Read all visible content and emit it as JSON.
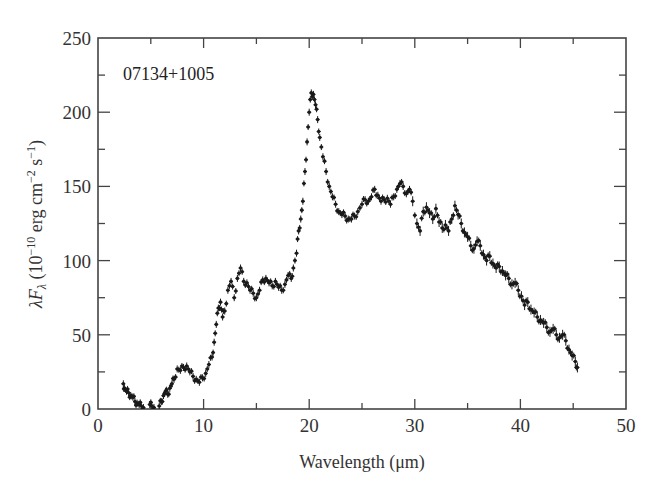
{
  "chart_data": {
    "type": "scatter",
    "title": "",
    "annotation": "07134+1005",
    "xlabel": "Wavelength (μm)",
    "ylabel": "λF_λ (10^-10 erg cm^-2 s^-1)",
    "xlim": [
      0,
      50
    ],
    "ylim": [
      0,
      250
    ],
    "xticks": [
      0,
      10,
      20,
      30,
      40,
      50
    ],
    "yticks": [
      0,
      50,
      100,
      150,
      200,
      250
    ],
    "x_minor_step": 5,
    "y_minor_step": 25,
    "grid": false,
    "legend": null,
    "marker": "point with error bars",
    "series": [
      {
        "name": "07134+1005",
        "points": [
          [
            2.4,
            17
          ],
          [
            2.5,
            14
          ],
          [
            2.7,
            12
          ],
          [
            2.9,
            11
          ],
          [
            3.1,
            9
          ],
          [
            3.3,
            8
          ],
          [
            3.5,
            5
          ],
          [
            3.7,
            4
          ],
          [
            3.9,
            3
          ],
          [
            4.1,
            2
          ],
          [
            4.3,
            1
          ],
          [
            4.9,
            3
          ],
          [
            5.1,
            2
          ],
          [
            5.3,
            1
          ],
          [
            5.8,
            2
          ],
          [
            6.0,
            5
          ],
          [
            6.2,
            9
          ],
          [
            6.4,
            12
          ],
          [
            6.6,
            10
          ],
          [
            6.8,
            14
          ],
          [
            7.0,
            17
          ],
          [
            7.2,
            20
          ],
          [
            7.5,
            27
          ],
          [
            7.8,
            26
          ],
          [
            8.1,
            28
          ],
          [
            8.4,
            29
          ],
          [
            8.7,
            25
          ],
          [
            9.0,
            22
          ],
          [
            9.3,
            20
          ],
          [
            9.6,
            18
          ],
          [
            9.9,
            21
          ],
          [
            10.2,
            24
          ],
          [
            10.5,
            30
          ],
          [
            10.8,
            35
          ],
          [
            11.0,
            45
          ],
          [
            11.2,
            57
          ],
          [
            11.4,
            68
          ],
          [
            11.6,
            72
          ],
          [
            11.8,
            62
          ],
          [
            12.0,
            66
          ],
          [
            12.3,
            80
          ],
          [
            12.6,
            86
          ],
          [
            12.9,
            75
          ],
          [
            13.2,
            88
          ],
          [
            13.5,
            95
          ],
          [
            13.8,
            86
          ],
          [
            14.1,
            85
          ],
          [
            14.4,
            80
          ],
          [
            14.7,
            78
          ],
          [
            15.0,
            75
          ],
          [
            15.3,
            80
          ],
          [
            15.6,
            87
          ],
          [
            15.9,
            88
          ],
          [
            16.2,
            85
          ],
          [
            16.5,
            83
          ],
          [
            16.8,
            86
          ],
          [
            17.1,
            82
          ],
          [
            17.4,
            80
          ],
          [
            17.7,
            84
          ],
          [
            18.0,
            90
          ],
          [
            18.3,
            88
          ],
          [
            18.5,
            95
          ],
          [
            18.8,
            105
          ],
          [
            19.0,
            120
          ],
          [
            19.2,
            128
          ],
          [
            19.4,
            140
          ],
          [
            19.6,
            160
          ],
          [
            19.8,
            180
          ],
          [
            20.0,
            200
          ],
          [
            20.2,
            213
          ],
          [
            20.4,
            212
          ],
          [
            20.6,
            205
          ],
          [
            20.8,
            195
          ],
          [
            21.0,
            183
          ],
          [
            21.3,
            170
          ],
          [
            21.6,
            160
          ],
          [
            21.9,
            150
          ],
          [
            22.2,
            143
          ],
          [
            22.5,
            138
          ],
          [
            22.8,
            133
          ],
          [
            23.1,
            131
          ],
          [
            23.4,
            130
          ],
          [
            23.7,
            128
          ],
          [
            24.0,
            128
          ],
          [
            24.3,
            130
          ],
          [
            24.6,
            133
          ],
          [
            25.0,
            138
          ],
          [
            25.3,
            141
          ],
          [
            25.6,
            140
          ],
          [
            25.9,
            143
          ],
          [
            26.2,
            148
          ],
          [
            26.5,
            144
          ],
          [
            26.8,
            140
          ],
          [
            27.1,
            141
          ],
          [
            27.4,
            142
          ],
          [
            27.7,
            138
          ],
          [
            28.0,
            143
          ],
          [
            28.3,
            148
          ],
          [
            28.6,
            152
          ],
          [
            28.9,
            150
          ],
          [
            29.2,
            145
          ],
          [
            29.5,
            148
          ],
          [
            29.8,
            140
          ],
          [
            30.2,
            125
          ],
          [
            30.5,
            120
          ],
          [
            30.8,
            133
          ],
          [
            31.1,
            136
          ],
          [
            31.4,
            132
          ],
          [
            31.7,
            128
          ],
          [
            32.0,
            135
          ],
          [
            32.3,
            126
          ],
          [
            32.6,
            122
          ],
          [
            32.9,
            124
          ],
          [
            33.2,
            120
          ],
          [
            33.5,
            128
          ],
          [
            33.8,
            137
          ],
          [
            34.1,
            131
          ],
          [
            34.4,
            125
          ],
          [
            34.7,
            119
          ],
          [
            35.0,
            116
          ],
          [
            35.3,
            110
          ],
          [
            35.6,
            108
          ],
          [
            35.9,
            113
          ],
          [
            36.2,
            110
          ],
          [
            36.5,
            104
          ],
          [
            36.8,
            100
          ],
          [
            37.1,
            103
          ],
          [
            37.4,
            98
          ],
          [
            37.7,
            95
          ],
          [
            38.0,
            96
          ],
          [
            38.3,
            93
          ],
          [
            38.6,
            90
          ],
          [
            38.9,
            88
          ],
          [
            39.2,
            84
          ],
          [
            39.5,
            85
          ],
          [
            39.8,
            80
          ],
          [
            40.1,
            76
          ],
          [
            40.4,
            70
          ],
          [
            40.7,
            72
          ],
          [
            41.0,
            67
          ],
          [
            41.3,
            65
          ],
          [
            41.6,
            62
          ],
          [
            41.9,
            60
          ],
          [
            42.2,
            58
          ],
          [
            42.5,
            55
          ],
          [
            42.8,
            52
          ],
          [
            43.1,
            54
          ],
          [
            43.4,
            50
          ],
          [
            43.7,
            48
          ],
          [
            44.0,
            50
          ],
          [
            44.3,
            46
          ],
          [
            44.6,
            40
          ],
          [
            44.9,
            36
          ],
          [
            45.2,
            32
          ],
          [
            45.4,
            28
          ]
        ]
      }
    ]
  },
  "colors": {
    "background": "#ffffff",
    "axis": "#444444",
    "points": "#1a1a1a",
    "text": "#333333"
  }
}
